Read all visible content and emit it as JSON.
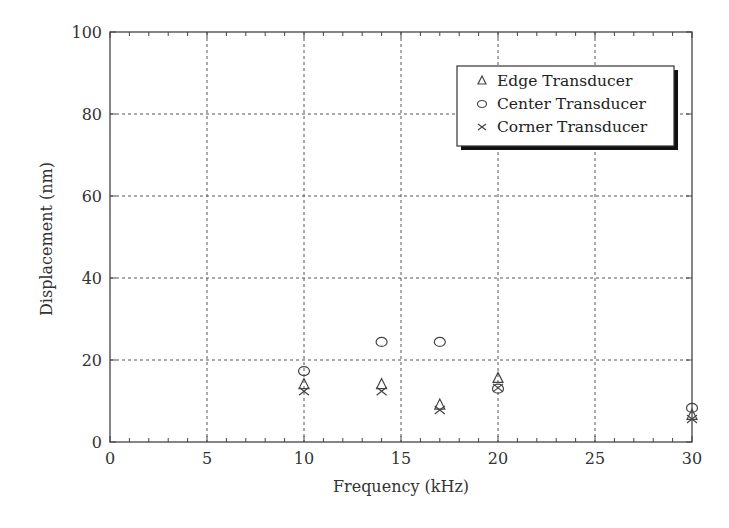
{
  "chart_data": {
    "type": "scatter",
    "title": "",
    "xlabel": "Frequency (kHz)",
    "ylabel": "Displacement (nm)",
    "xlim": [
      0,
      30
    ],
    "ylim": [
      0,
      100
    ],
    "x_ticks": [
      0,
      5,
      10,
      15,
      20,
      25,
      30
    ],
    "y_ticks": [
      0,
      20,
      40,
      60,
      80,
      100
    ],
    "x_minor_step": 1,
    "grid": true,
    "legend_position": "upper right",
    "series": [
      {
        "name": "Edge Transducer",
        "marker": "triangle",
        "x": [
          10,
          14,
          17,
          20,
          30
        ],
        "y": [
          14.0,
          14.0,
          9.0,
          15.5,
          6.5
        ]
      },
      {
        "name": "Center Transducer",
        "marker": "circle",
        "x": [
          10,
          14,
          17,
          20,
          30
        ],
        "y": [
          17.3,
          24.4,
          24.4,
          13.0,
          8.3
        ]
      },
      {
        "name": "Corner Transducer",
        "marker": "x",
        "x": [
          10,
          14,
          17,
          20,
          30
        ],
        "y": [
          12.4,
          12.4,
          7.8,
          13.2,
          5.6
        ]
      }
    ]
  },
  "legend": {
    "items": [
      {
        "label": "Edge Transducer",
        "icon": "triangle-marker-icon"
      },
      {
        "label": "Center Transducer",
        "icon": "circle-marker-icon"
      },
      {
        "label": "Corner Transducer",
        "icon": "x-marker-icon"
      }
    ]
  },
  "colors": {
    "axis": "#444444",
    "grid": "#555555",
    "marker": "#444444"
  }
}
